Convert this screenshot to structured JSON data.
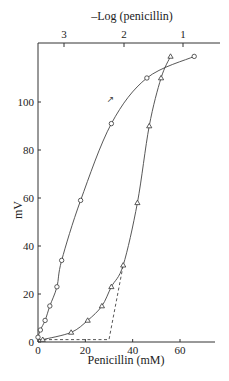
{
  "chart_data": {
    "type": "line",
    "title": "",
    "xlabel": "Penicillin (mM)",
    "ylabel": "mV",
    "x2label": "–Log (penicillin)",
    "xlim": [
      0,
      75
    ],
    "ylim": [
      0,
      125
    ],
    "xticks": [
      0,
      20,
      40,
      60
    ],
    "yticks": [
      0,
      20,
      40,
      60,
      80,
      100
    ],
    "x2ticks": [
      {
        "label": "3",
        "x_mM": 1
      },
      {
        "label": "2",
        "x_mM": 10
      },
      {
        "label": "1",
        "x_mM": 100
      }
    ],
    "grid": false,
    "legend": "none",
    "series": [
      {
        "name": "vs –Log (penicillin)",
        "marker": "circle",
        "points": [
          [
            0,
            2
          ],
          [
            1,
            5
          ],
          [
            3,
            9
          ],
          [
            5,
            15
          ],
          [
            8,
            23
          ],
          [
            10,
            34
          ],
          [
            18,
            59
          ],
          [
            31,
            91
          ],
          [
            46,
            110
          ],
          [
            66,
            119
          ]
        ]
      },
      {
        "name": "vs Penicillin (mM)",
        "marker": "triangle",
        "points": [
          [
            2,
            1
          ],
          [
            14,
            4
          ],
          [
            21,
            9
          ],
          [
            27,
            15
          ],
          [
            31,
            23
          ],
          [
            36,
            32
          ],
          [
            42,
            58
          ],
          [
            47,
            90
          ],
          [
            52,
            110
          ],
          [
            56,
            119
          ]
        ]
      }
    ],
    "dashed_line": {
      "points": [
        [
          0,
          1
        ],
        [
          30,
          1
        ],
        [
          36,
          32
        ]
      ]
    },
    "annotations": [
      {
        "text": "↗",
        "near": [
          29,
          100
        ]
      }
    ]
  }
}
